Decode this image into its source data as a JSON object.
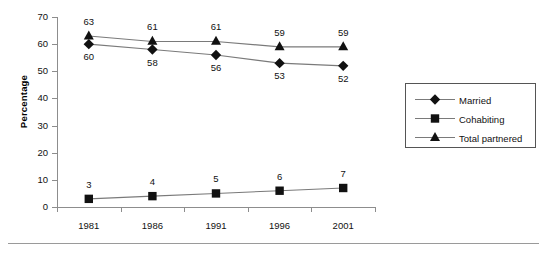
{
  "chart_data": {
    "type": "line",
    "title": "",
    "xlabel": "",
    "ylabel": "Percentage",
    "categories": [
      "1981",
      "1986",
      "1991",
      "1996",
      "2001"
    ],
    "ylim": [
      0,
      70
    ],
    "yticks": [
      "0",
      "10",
      "20",
      "30",
      "40",
      "50",
      "60",
      "70"
    ],
    "grid": false,
    "legend_position": "right",
    "series": [
      {
        "name": "Married",
        "marker": "diamond",
        "label_position": "below",
        "values": [
          60,
          58,
          56,
          53,
          52
        ],
        "labels": [
          "60",
          "58",
          "56",
          "53",
          "52"
        ]
      },
      {
        "name": "Cohabiting",
        "marker": "square",
        "label_position": "above",
        "values": [
          3,
          4,
          5,
          6,
          7
        ],
        "labels": [
          "3",
          "4",
          "5",
          "6",
          "7"
        ]
      },
      {
        "name": "Total partnered",
        "marker": "triangle",
        "label_position": "above",
        "values": [
          63,
          61,
          61,
          59,
          59
        ],
        "labels": [
          "63",
          "61",
          "61",
          "59",
          "59"
        ]
      }
    ],
    "colors": {
      "marker": "#111111",
      "line": "#7a7a7a",
      "axis": "#8d8d8d",
      "text": "#111111",
      "background": "#ffffff"
    }
  },
  "legend": {
    "items": [
      {
        "label": "Married",
        "icon": "diamond-marker-icon"
      },
      {
        "label": "Cohabiting",
        "icon": "square-marker-icon"
      },
      {
        "label": "Total partnered",
        "icon": "triangle-marker-icon"
      }
    ]
  }
}
